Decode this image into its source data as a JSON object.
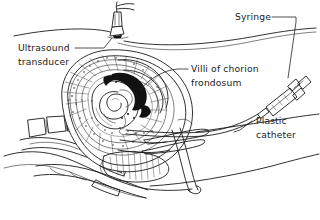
{
  "figure": {
    "background_color": "#ffffff",
    "ink_color": "#1a1a1a",
    "width": 320,
    "height": 220
  },
  "labels": {
    "ultrasound_transducer": {
      "line1": "Ultrasound",
      "line2": "transducer"
    },
    "villi": {
      "line1": "Villi of chorion",
      "line2": "frondosum"
    },
    "syringe": {
      "line1": "Syringe"
    },
    "catheter": {
      "line1": "Plastic",
      "line2": "catheter"
    }
  },
  "anatomy": {
    "parts": [
      "abdominal-wall",
      "uterus",
      "chorion-frondosum-villi",
      "fetus",
      "amniotic-sac",
      "cervix",
      "vagina",
      "bladder",
      "rectum",
      "sacrum",
      "maternal-back"
    ]
  },
  "instruments": {
    "items": [
      "ultrasound-transducer",
      "transducer-cable",
      "syringe",
      "syringe-plunger",
      "plastic-catheter",
      "vaginal-speculum"
    ]
  }
}
